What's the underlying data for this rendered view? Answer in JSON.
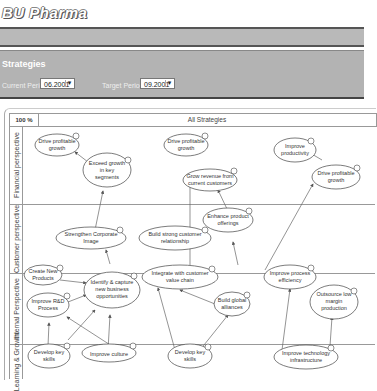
{
  "app": {
    "brand": "BU Pharma"
  },
  "panel": {
    "title": "Strategies",
    "current_period_label": "Current Period:",
    "current_period_value": "06.2001",
    "target_period_label": "Target Period:",
    "target_period_value": "09.2001"
  },
  "map": {
    "zoom": "100 %",
    "title": "All Strategies",
    "lanes": [
      {
        "label": "Financial perspective",
        "icon": "status-icon"
      },
      {
        "label": "Customer perspective",
        "icon": "status-icon"
      },
      {
        "label": "Internal Perspective",
        "icon": "status-icon"
      },
      {
        "label": "Learning & Growth",
        "icon": "status-icon"
      }
    ],
    "nodes": [
      {
        "id": "n1",
        "label": [
          "Drive profitable",
          "growth"
        ]
      },
      {
        "id": "n2",
        "label": [
          "Exceed growth",
          "in key",
          "segments"
        ]
      },
      {
        "id": "n3",
        "label": [
          "Drive profitable",
          "growth"
        ]
      },
      {
        "id": "n4",
        "label": [
          "Grow revenue from",
          "current customers"
        ]
      },
      {
        "id": "n5",
        "label": [
          "Improve",
          "productivity"
        ]
      },
      {
        "id": "n6",
        "label": [
          "Drive profitable",
          "growth"
        ]
      },
      {
        "id": "n7",
        "label": [
          "Strengthen Corporate",
          "Image"
        ]
      },
      {
        "id": "n8",
        "label": [
          "Enhance product",
          "offerings"
        ]
      },
      {
        "id": "n9",
        "label": [
          "Build strong customer",
          "relationship"
        ]
      },
      {
        "id": "n10",
        "label": [
          "Create New",
          "Products"
        ]
      },
      {
        "id": "n11",
        "label": [
          "Identify & capture",
          "new business",
          "opportunities"
        ]
      },
      {
        "id": "n12",
        "label": [
          "Integrate with customer",
          "value chain"
        ]
      },
      {
        "id": "n13",
        "label": [
          "Improve process",
          "efficiency"
        ]
      },
      {
        "id": "n14",
        "label": [
          "Improve R&D",
          "Process"
        ]
      },
      {
        "id": "n15",
        "label": [
          "Build global",
          "alliances"
        ]
      },
      {
        "id": "n16",
        "label": [
          "Outsource low",
          "margin",
          "production"
        ]
      },
      {
        "id": "n17",
        "label": [
          "Develop key",
          "skills"
        ]
      },
      {
        "id": "n18",
        "label": [
          "Improve culture"
        ]
      },
      {
        "id": "n19",
        "label": [
          "Develop key",
          "skills"
        ]
      },
      {
        "id": "n20",
        "label": [
          "Improve technology",
          "infrastructure"
        ]
      }
    ]
  }
}
